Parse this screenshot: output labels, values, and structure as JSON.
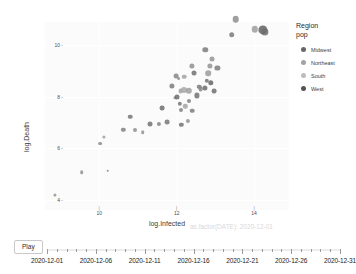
{
  "chart_data": {
    "type": "scatter",
    "title": "",
    "xlabel": "log.Infected",
    "ylabel": "log.Death",
    "xlim": [
      8.6,
      14.9
    ],
    "ylim": [
      3.6,
      10.9
    ],
    "xticks": [
      "10",
      "12",
      "14"
    ],
    "xtick_values": [
      10,
      12,
      14
    ],
    "yticks": [
      "10",
      "8",
      "6",
      "4"
    ],
    "ytick_values": [
      10,
      8,
      6,
      4
    ],
    "grid": true,
    "legend_position": "right",
    "frame_annotation": "as.factor(DATE): 2020-12-01",
    "legend_title_line1": "Region",
    "legend_title_line2": "pop",
    "legend": [
      {
        "label": "Midwest",
        "color": "#666666"
      },
      {
        "label": "Northeast",
        "color": "#a3a3a3"
      },
      {
        "label": "South",
        "color": "#bdbdbd"
      },
      {
        "label": "West",
        "color": "#555555"
      }
    ],
    "size_legend_note": "pop",
    "points": [
      {
        "x": 8.85,
        "y": 4.18,
        "r": 1.6,
        "color": "#8f8f8f",
        "region": "Northeast"
      },
      {
        "x": 9.55,
        "y": 5.07,
        "r": 1.8,
        "color": "#8c8c8c",
        "region": "Northeast"
      },
      {
        "x": 10.22,
        "y": 5.12,
        "r": 1.3,
        "color": "#7a7a7a",
        "region": "West"
      },
      {
        "x": 10.02,
        "y": 6.18,
        "r": 1.9,
        "color": "#888888",
        "region": "Northeast"
      },
      {
        "x": 10.12,
        "y": 6.45,
        "r": 1.6,
        "color": "#9a9a9a",
        "region": "South"
      },
      {
        "x": 10.62,
        "y": 6.72,
        "r": 2.2,
        "color": "#7d7d7d",
        "region": "Midwest"
      },
      {
        "x": 10.92,
        "y": 6.7,
        "r": 2.0,
        "color": "#8a8a8a",
        "region": "Midwest"
      },
      {
        "x": 10.8,
        "y": 7.22,
        "r": 2.3,
        "color": "#707070",
        "region": "Midwest"
      },
      {
        "x": 11.12,
        "y": 6.62,
        "r": 1.8,
        "color": "#8d8d8d",
        "region": "South"
      },
      {
        "x": 11.3,
        "y": 6.93,
        "r": 2.5,
        "color": "#6d6d6d",
        "region": "West"
      },
      {
        "x": 11.55,
        "y": 6.95,
        "r": 2.1,
        "color": "#7f7f7f",
        "region": "Midwest"
      },
      {
        "x": 11.75,
        "y": 7.02,
        "r": 2.4,
        "color": "#737373",
        "region": "South"
      },
      {
        "x": 11.62,
        "y": 7.55,
        "r": 2.4,
        "color": "#6a6a6a",
        "region": "West"
      },
      {
        "x": 11.88,
        "y": 8.42,
        "r": 2.6,
        "color": "#777777",
        "region": "Midwest"
      },
      {
        "x": 11.95,
        "y": 7.95,
        "r": 1.7,
        "color": "#9c9c9c",
        "region": "South"
      },
      {
        "x": 12.05,
        "y": 8.7,
        "r": 1.9,
        "color": "#8b8b8b",
        "region": "Northeast"
      },
      {
        "x": 12.1,
        "y": 8.22,
        "r": 2.4,
        "color": "#9e9e9e",
        "region": "South"
      },
      {
        "x": 12.18,
        "y": 8.25,
        "r": 3.0,
        "color": "#a5a5a5",
        "region": "South"
      },
      {
        "x": 12.32,
        "y": 8.24,
        "r": 3.2,
        "color": "#9b9b9b",
        "region": "South"
      },
      {
        "x": 12.08,
        "y": 7.72,
        "r": 2.2,
        "color": "#6f6f6f",
        "region": "West"
      },
      {
        "x": 12.12,
        "y": 7.48,
        "r": 2.0,
        "color": "#7c7c7c",
        "region": "Midwest"
      },
      {
        "x": 12.22,
        "y": 7.62,
        "r": 2.2,
        "color": "#a0a0a0",
        "region": "South"
      },
      {
        "x": 12.02,
        "y": 7.98,
        "r": 2.5,
        "color": "#676767",
        "region": "West"
      },
      {
        "x": 12.32,
        "y": 7.82,
        "r": 2.0,
        "color": "#7b7b7b",
        "region": "Midwest"
      },
      {
        "x": 12.4,
        "y": 7.45,
        "r": 2.3,
        "color": "#787878",
        "region": "Midwest"
      },
      {
        "x": 12.28,
        "y": 7.05,
        "r": 2.1,
        "color": "#8e8e8e",
        "region": "South"
      },
      {
        "x": 12.12,
        "y": 6.92,
        "r": 2.2,
        "color": "#6c6c6c",
        "region": "West"
      },
      {
        "x": 12.52,
        "y": 8.05,
        "r": 2.6,
        "color": "#6e6e6e",
        "region": "West"
      },
      {
        "x": 12.58,
        "y": 8.38,
        "r": 2.3,
        "color": "#757575",
        "region": "Midwest"
      },
      {
        "x": 12.45,
        "y": 8.92,
        "r": 2.5,
        "color": "#6b6b6b",
        "region": "West"
      },
      {
        "x": 12.62,
        "y": 8.3,
        "r": 2.4,
        "color": "#828282",
        "region": "Midwest"
      },
      {
        "x": 12.72,
        "y": 8.35,
        "r": 2.6,
        "color": "#666666",
        "region": "Midwest"
      },
      {
        "x": 12.78,
        "y": 8.62,
        "r": 2.2,
        "color": "#6f6f6f",
        "region": "West"
      },
      {
        "x": 12.82,
        "y": 8.92,
        "r": 2.8,
        "color": "#979797",
        "region": "South"
      },
      {
        "x": 12.86,
        "y": 9.2,
        "r": 2.6,
        "color": "#8f8f8f",
        "region": "Northeast"
      },
      {
        "x": 12.88,
        "y": 8.55,
        "r": 2.7,
        "color": "#5f5f5f",
        "region": "West"
      },
      {
        "x": 12.92,
        "y": 9.48,
        "r": 2.5,
        "color": "#909090",
        "region": "South"
      },
      {
        "x": 12.96,
        "y": 8.22,
        "r": 2.4,
        "color": "#6a6a6a",
        "region": "Midwest"
      },
      {
        "x": 12.74,
        "y": 9.82,
        "r": 2.7,
        "color": "#777777",
        "region": "Midwest"
      },
      {
        "x": 12.4,
        "y": 9.18,
        "r": 2.6,
        "color": "#8b8b8b",
        "region": "South"
      },
      {
        "x": 12.2,
        "y": 8.78,
        "r": 2.3,
        "color": "#9d9d9d",
        "region": "South"
      },
      {
        "x": 11.98,
        "y": 8.8,
        "r": 2.4,
        "color": "#818181",
        "region": "Northeast"
      },
      {
        "x": 13.05,
        "y": 9.12,
        "r": 2.6,
        "color": "#777777",
        "region": "Midwest"
      },
      {
        "x": 13.42,
        "y": 10.4,
        "r": 2.8,
        "color": "#757575",
        "region": "West"
      },
      {
        "x": 13.52,
        "y": 11.02,
        "r": 3.3,
        "color": "#8a8a8a",
        "region": "South"
      },
      {
        "x": 14.02,
        "y": 10.62,
        "r": 3.2,
        "color": "#9b9b9b",
        "region": "South"
      },
      {
        "x": 14.22,
        "y": 10.58,
        "r": 4.6,
        "color": "#5a5a5a",
        "region": "West"
      },
      {
        "x": 14.28,
        "y": 10.5,
        "r": 3.6,
        "color": "#6d6d6d",
        "region": "West"
      }
    ]
  },
  "slider": {
    "play_label": "Play",
    "labels": [
      "2020-12-01",
      "2020-12-06",
      "2020-12-11",
      "2020-12-16",
      "2020-12-21",
      "2020-12-26",
      "2020-12-31"
    ],
    "tick_count": 31,
    "major_every": 5,
    "current_index": 0
  }
}
